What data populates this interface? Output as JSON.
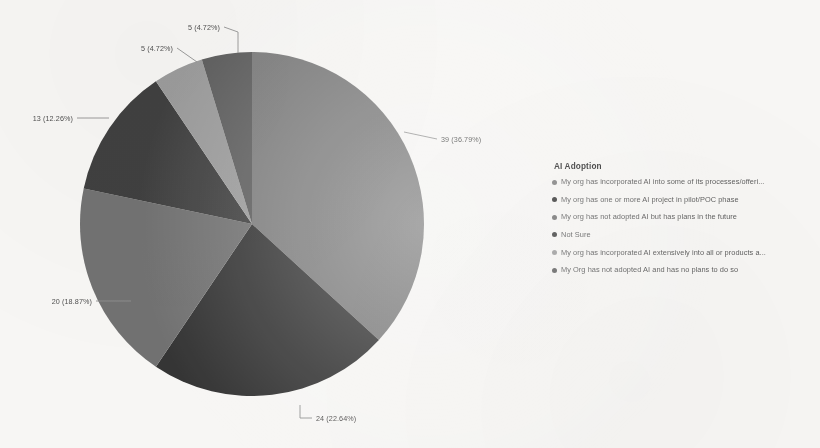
{
  "chart_data": {
    "type": "pie",
    "title": "AI Adoption",
    "total": 106,
    "legend_position": "right",
    "grid": false,
    "categories": [
      "My org has incorporated AI into some of its processes/offeri...",
      "My org has one or more AI project in pilot/POC phase",
      "My org has not adopted AI but has plans in the future",
      "Not Sure",
      "My org has incorporated AI extensively into all or products a...",
      "My Org has not adopted AI and has no plans to do so"
    ],
    "values": [
      39,
      24,
      20,
      13,
      5,
      5
    ],
    "percents": [
      36.79,
      22.64,
      18.87,
      12.26,
      4.72,
      4.72
    ],
    "data_labels": [
      "39 (36.79%)",
      "24 (22.64%)",
      "20 (18.87%)",
      "13 (12.26%)",
      "5 (4.72%)",
      "5 (4.72%)"
    ],
    "colors": [
      "#7a7a7a",
      "#2e2e2e",
      "#6e6e6e",
      "#3a3a3a",
      "#9a9a9a",
      "#5a5a5a"
    ],
    "background": "#f7f6f4"
  },
  "legend": {
    "title": "AI Adoption",
    "items": [
      {
        "label": "My org has incorporated AI into some of its processes/offeri...",
        "color": "#7a7a7a"
      },
      {
        "label": "My org has one or more AI project in pilot/POC phase",
        "color": "#2e2e2e"
      },
      {
        "label": "My org has not adopted AI but has plans in the future",
        "color": "#6e6e6e"
      },
      {
        "label": "Not Sure",
        "color": "#3a3a3a"
      },
      {
        "label": "My org has incorporated AI extensively into all or products a...",
        "color": "#9a9a9a"
      },
      {
        "label": "My Org has not adopted AI and has no plans to do so",
        "color": "#5a5a5a"
      }
    ]
  },
  "labels": {
    "l0": "39 (36.79%)",
    "l1": "24 (22.64%)",
    "l2": "20 (18.87%)",
    "l3": "13 (12.26%)",
    "l4": "5 (4.72%)",
    "l5": "5 (4.72%)"
  }
}
